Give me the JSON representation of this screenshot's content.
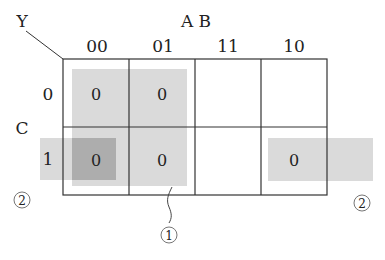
{
  "output_label": "Y",
  "column_variables": "A B",
  "row_variable": "C",
  "columns": [
    "00",
    "01",
    "11",
    "10"
  ],
  "rows": [
    "0",
    "1"
  ],
  "cells": [
    [
      "0",
      "0",
      "",
      ""
    ],
    [
      "0",
      "0",
      "",
      "0"
    ]
  ],
  "groups": [
    {
      "id": "1",
      "label": "①",
      "cells": [
        [
          0,
          0
        ],
        [
          0,
          1
        ],
        [
          1,
          0
        ],
        [
          1,
          1
        ]
      ]
    },
    {
      "id": "2",
      "label": "②",
      "cells": [
        [
          1,
          0
        ],
        [
          1,
          3
        ]
      ],
      "wraps": true
    }
  ],
  "colors": {
    "grid": "#333333",
    "group_fill": "#d9d9d9",
    "overlap_fill": "#ababab"
  }
}
